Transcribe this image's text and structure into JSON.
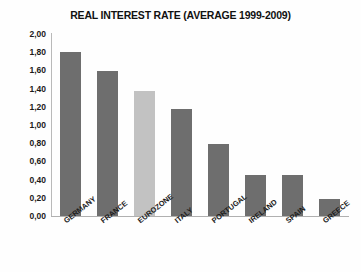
{
  "chart_data": {
    "type": "bar",
    "title": "REAL INTEREST RATE (AVERAGE 1999-2009)",
    "xlabel": "",
    "ylabel": "",
    "categories": [
      "GERMANY",
      "FRANCE",
      "EUROZONE",
      "ITALY",
      "PORTUGAL",
      "IRELAND",
      "SPAIN",
      "GREECE"
    ],
    "values": [
      1.8,
      1.59,
      1.37,
      1.18,
      0.79,
      0.45,
      0.45,
      0.19
    ],
    "value_labels": [
      "1,80",
      "1,59",
      "1,37",
      "1,18",
      "0,79",
      "0,45",
      "0,45",
      "0,19"
    ],
    "bar_colors": [
      "#6e6e6e",
      "#6e6e6e",
      "#c2c2c2",
      "#6e6e6e",
      "#6e6e6e",
      "#6e6e6e",
      "#6e6e6e",
      "#6e6e6e"
    ],
    "highlight_category": "EUROZONE",
    "ylim": [
      0,
      2.0
    ],
    "ytick_values": [
      2.0,
      1.8,
      1.6,
      1.4,
      1.2,
      1.0,
      0.8,
      0.6,
      0.4,
      0.2,
      0.0
    ],
    "ytick_labels": [
      "2,00",
      "1,80",
      "1,60",
      "1,40",
      "1,20",
      "1,00",
      "0,80",
      "0,60",
      "0,40",
      "0,20",
      "0,00"
    ],
    "grid": false,
    "legend": "none",
    "decimal_separator": ","
  },
  "axis_colors": {
    "y_axis_line": "#b9b9b9",
    "x_axis_line": "#b0b0b0",
    "bar_dark": "#6e6e6e",
    "bar_light": "#c2c2c2",
    "text": "#1a1a1a",
    "background": "#fefefe"
  }
}
